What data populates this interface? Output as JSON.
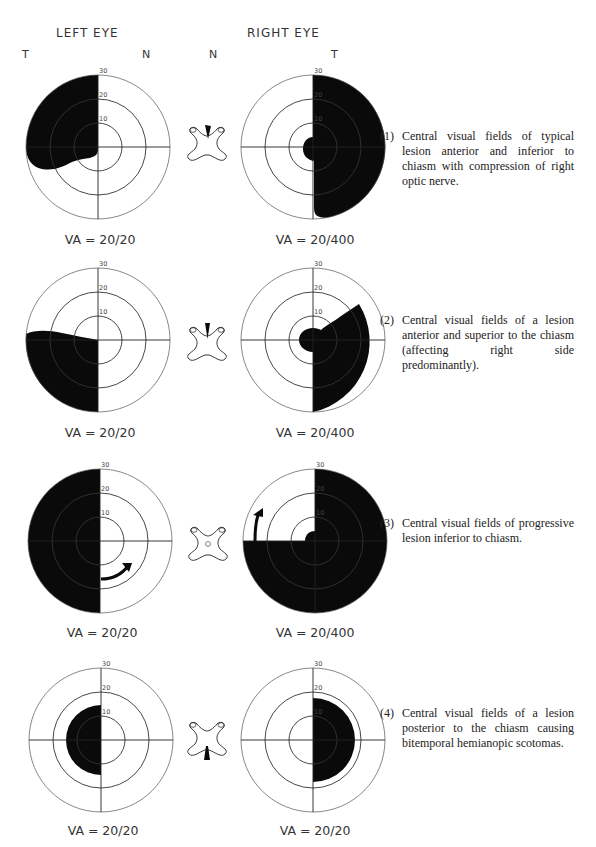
{
  "header": {
    "left_eye": "LEFT EYE",
    "right_eye": "RIGHT EYE",
    "left_t": "T",
    "left_n": "N",
    "right_n": "N",
    "right_t": "T"
  },
  "ring_labels": [
    "10",
    "20",
    "30"
  ],
  "colors": {
    "fill": "#0a0a0a",
    "line": "#444444",
    "bg": "#ffffff"
  },
  "rows": [
    {
      "left_va": "VA = 20/20",
      "right_va": "VA = 20/400",
      "caption_num": "(1)",
      "caption": "Central visual fields of typical lesion anterior and inferior to chiasm with compression of right optic nerve.",
      "chiasm_marker": "wedge-top-right"
    },
    {
      "left_va": "VA = 20/20",
      "right_va": "VA = 20/400",
      "caption_num": "(2)",
      "caption": "Central visual fields of a lesion anterior and superior to the chiasm (affecting right side predominantly).",
      "chiasm_marker": "wedge-top-center"
    },
    {
      "left_va": "VA = 20/20",
      "right_va": "VA = 20/400",
      "caption_num": "(3)",
      "caption": "Central visual fields of progressive lesion inferior to chiasm.",
      "chiasm_marker": "spot-center"
    },
    {
      "left_va": "VA = 20/20",
      "right_va": "VA = 20/20",
      "caption_num": "(4)",
      "caption": "Central visual fields of a lesion posterior to the chiasm causing bitemporal hemianopic scotomas.",
      "chiasm_marker": "wedge-bottom-center"
    }
  ]
}
